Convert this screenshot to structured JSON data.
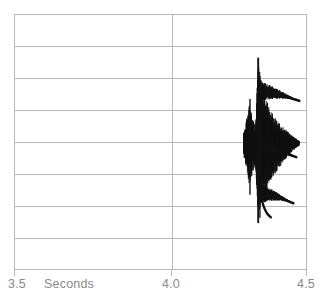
{
  "figure": {
    "name": "speech-waveform-plot",
    "background_color": "#ffffff",
    "grid_color": "#b9b9b9",
    "trace_color": "#111111",
    "label_color": "#8a8a8a"
  },
  "axis": {
    "title": "Seconds",
    "tick_labels": [
      "3.5",
      "4.0",
      "4.5"
    ],
    "start": "3.5",
    "mid": "4.0",
    "end": "4.5"
  },
  "chart_data": {
    "type": "line",
    "title": "",
    "subtitle": "",
    "xlabel": "Seconds",
    "ylabel": "",
    "xlim": [
      3.5,
      4.5
    ],
    "ylim": [
      -1,
      1
    ],
    "xticks": [
      3.5,
      4.0,
      4.5
    ],
    "xticklabels": [
      "3.5",
      "4.0",
      "4.5"
    ],
    "yticks": [],
    "yticklabels": [],
    "grid": "horizontal-and-vertical",
    "grid_rows": 8,
    "grid_columns": 2,
    "legend": "none",
    "annotations": [],
    "series": [
      {
        "name": "amplitude",
        "description": "dense oscillographic speech waveform burst with three decaying voiced pulse trains",
        "x_range": [
          4.28,
          4.47
        ],
        "peak_positive": 0.62,
        "peak_negative": -0.58,
        "envelope_x": [
          4.28,
          4.3,
          4.32,
          4.33,
          4.35,
          4.37,
          4.4,
          4.43,
          4.45,
          4.47
        ],
        "envelope_upper": [
          0.08,
          0.3,
          0.12,
          0.62,
          0.4,
          0.26,
          0.16,
          0.09,
          0.05,
          0.02
        ],
        "envelope_lower": [
          -0.1,
          -0.34,
          -0.16,
          -0.56,
          -0.44,
          -0.3,
          -0.2,
          -0.11,
          -0.06,
          -0.02
        ],
        "pulse_trains": [
          {
            "center_y_fraction": 0.3,
            "start_x": 4.33,
            "end_x": 4.47
          },
          {
            "center_y_fraction": 0.52,
            "start_x": 4.34,
            "end_x": 4.46
          },
          {
            "center_y_fraction": 0.7,
            "start_x": 4.34,
            "end_x": 4.45
          }
        ]
      }
    ]
  }
}
